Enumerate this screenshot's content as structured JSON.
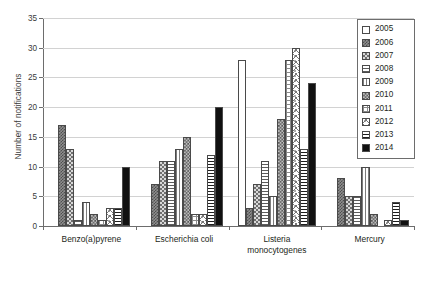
{
  "chart_data": {
    "type": "bar",
    "title": "",
    "xlabel": "",
    "ylabel": "Number of notifications",
    "ylim": [
      0,
      35
    ],
    "yticks": [
      0,
      5,
      10,
      15,
      20,
      25,
      30,
      35
    ],
    "grid": true,
    "legend_position": "top-right",
    "categories": [
      "Benzo(a)pyrene",
      "Escherichia coli",
      "Listeria monocytogenes",
      "Mercury"
    ],
    "series": [
      {
        "name": "2005",
        "pattern": "fine-dots-light",
        "values": [
          0,
          0,
          28,
          0
        ]
      },
      {
        "name": "2006",
        "pattern": "dense-checker-dark",
        "values": [
          17,
          7,
          3,
          8
        ]
      },
      {
        "name": "2007",
        "pattern": "checker-mid",
        "values": [
          13,
          11,
          7,
          5
        ]
      },
      {
        "name": "2008",
        "pattern": "horizontal-lines",
        "values": [
          1,
          11,
          11,
          5
        ]
      },
      {
        "name": "2009",
        "pattern": "vertical-lines",
        "values": [
          4,
          13,
          5,
          10
        ]
      },
      {
        "name": "2010",
        "pattern": "checker-coarse",
        "values": [
          2,
          15,
          18,
          2
        ]
      },
      {
        "name": "2011",
        "pattern": "grid-crosshatch",
        "values": [
          1,
          2,
          28,
          0
        ]
      },
      {
        "name": "2012",
        "pattern": "diagonal-crosshatch",
        "values": [
          3,
          2,
          30,
          1
        ]
      },
      {
        "name": "2013",
        "pattern": "thick-horizontal",
        "values": [
          3,
          12,
          13,
          4
        ]
      },
      {
        "name": "2014",
        "pattern": "solid-black",
        "values": [
          10,
          20,
          24,
          1
        ]
      }
    ]
  },
  "axis": {
    "y_label": "Number of notifications",
    "y_tick_labels": [
      "0",
      "5",
      "10",
      "15",
      "20",
      "25",
      "30",
      "35"
    ]
  },
  "legend": {
    "items": [
      {
        "label": "2005"
      },
      {
        "label": "2006"
      },
      {
        "label": "2007"
      },
      {
        "label": "2008"
      },
      {
        "label": "2009"
      },
      {
        "label": "2010"
      },
      {
        "label": "2011"
      },
      {
        "label": "2012"
      },
      {
        "label": "2013"
      },
      {
        "label": "2014"
      }
    ]
  },
  "groups": [
    {
      "label": "Benzo(a)pyrene"
    },
    {
      "label": "Escherichia coli"
    },
    {
      "label": "Listeria monocytogenes"
    },
    {
      "label": "Mercury"
    }
  ],
  "caption": ""
}
